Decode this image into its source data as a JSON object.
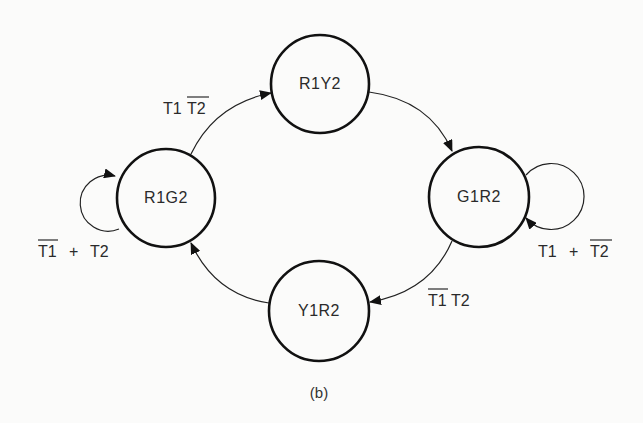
{
  "diagram": {
    "type": "state-diagram",
    "caption": "(b)",
    "states": [
      {
        "id": "R1G2",
        "label": "R1G2",
        "cx": 166,
        "cy": 198,
        "r": 49
      },
      {
        "id": "R1Y2",
        "label": "R1Y2",
        "cx": 320,
        "cy": 84,
        "r": 49
      },
      {
        "id": "G1R2",
        "label": "G1R2",
        "cx": 479,
        "cy": 197,
        "r": 50
      },
      {
        "id": "Y1R2",
        "label": "Y1R2",
        "cx": 319,
        "cy": 311,
        "r": 50
      }
    ],
    "transitions": [
      {
        "from": "R1G2",
        "to": "R1Y2",
        "label": "T1T̄2",
        "label_parts": [
          {
            "text": "T1",
            "bar": false
          },
          {
            "text": "T2",
            "bar": true
          }
        ]
      },
      {
        "from": "R1Y2",
        "to": "G1R2",
        "label": ""
      },
      {
        "from": "G1R2",
        "to": "Y1R2",
        "label": "T̄1T2",
        "label_parts": [
          {
            "text": "T1",
            "bar": true
          },
          {
            "text": "T2",
            "bar": false
          }
        ]
      },
      {
        "from": "Y1R2",
        "to": "R1G2",
        "label": ""
      },
      {
        "from": "R1G2",
        "to": "R1G2",
        "label": "T̄1 + T2",
        "label_parts": [
          {
            "text": "T1",
            "bar": true
          },
          {
            "text": " + ",
            "bar": false
          },
          {
            "text": "T2",
            "bar": false
          }
        ]
      },
      {
        "from": "G1R2",
        "to": "G1R2",
        "label": "T1 + T̄2",
        "label_parts": [
          {
            "text": "T1",
            "bar": false
          },
          {
            "text": " + ",
            "bar": false
          },
          {
            "text": "T2",
            "bar": true
          }
        ]
      }
    ],
    "text": {
      "r1g2": "R1G2",
      "r1y2": "R1Y2",
      "g1r2": "G1R2",
      "y1r2": "Y1R2",
      "t1": "T1",
      "t2": "T2",
      "plus": "+",
      "caption": "(b)"
    }
  }
}
